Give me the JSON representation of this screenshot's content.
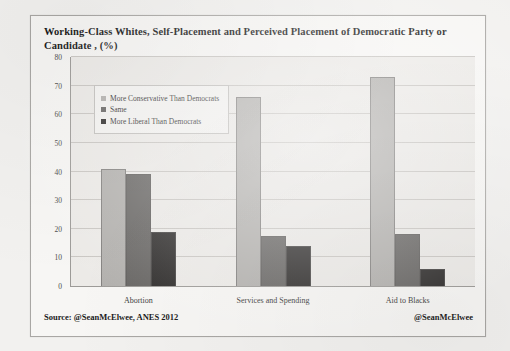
{
  "chart_data": {
    "type": "bar",
    "title": "Working-Class Whites, Self-Placement and Perceived Placement of Democratic Party or Candidate , (%)",
    "categories": [
      "Abortion",
      "Services and Spending",
      "Aid to Blacks"
    ],
    "series": [
      {
        "name": "More Conservative Than Democrats",
        "color": "#b2b0ad",
        "values": [
          41,
          66,
          73
        ]
      },
      {
        "name": "Same",
        "color": "#676563",
        "values": [
          39,
          17.5,
          18
        ]
      },
      {
        "name": "More Liberal Than Democrats",
        "color": "#2e2c2b",
        "values": [
          19,
          14,
          6
        ]
      }
    ],
    "xlabel": "",
    "ylabel": "",
    "ylim": [
      0,
      80
    ],
    "yticks": [
      0,
      10,
      20,
      30,
      40,
      50,
      60,
      70,
      80
    ],
    "grid": true,
    "legend_position": "top-left-inside"
  },
  "footer": {
    "source": "Source: @SeanMcElwee, ANES 2012",
    "handle": "@SeanMcElwee"
  }
}
